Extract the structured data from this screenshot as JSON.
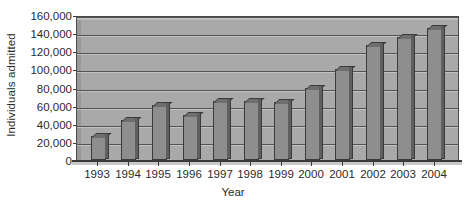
{
  "chart_data": {
    "type": "bar",
    "title": "",
    "xlabel": "Year",
    "ylabel": "Individuals admitted",
    "categories": [
      "1993",
      "1994",
      "1995",
      "1996",
      "1997",
      "1998",
      "1999",
      "2000",
      "2001",
      "2002",
      "2003",
      "2004"
    ],
    "values": [
      27000,
      44000,
      61000,
      50000,
      65000,
      65000,
      64000,
      79000,
      100000,
      127000,
      136000,
      146000
    ],
    "ylim": [
      0,
      160000
    ],
    "ytick_values": [
      0,
      20000,
      40000,
      60000,
      80000,
      100000,
      120000,
      140000,
      160000
    ],
    "ytick_labels": [
      "0",
      "20,000",
      "40,000",
      "60,000",
      "80,000",
      "100,000",
      "120,000",
      "140,000",
      "160,000"
    ],
    "grid": true,
    "legend": false,
    "style": "3d-bar",
    "colors": {
      "plot_background": "#a9a9a9",
      "bar_face": "#8e8e8e",
      "bar_top": "#6f6f6f",
      "bar_side": "#5f5f5f",
      "bar_outline": "#3b3b3b",
      "gridline": "#535353",
      "axis": "#3a3a3a",
      "text": "#2b2b2b",
      "page_background": "#ffffff"
    }
  }
}
